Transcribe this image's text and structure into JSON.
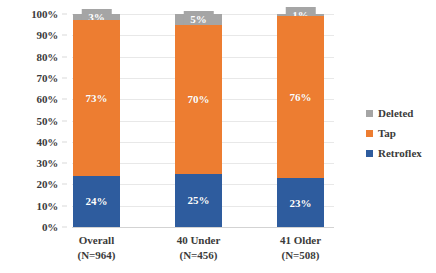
{
  "chart_data": {
    "type": "bar",
    "subtype": "stacked-100-percent",
    "title": "",
    "xlabel": "",
    "ylabel": "",
    "ylim": [
      0,
      100
    ],
    "grid": true,
    "legend_position": "right",
    "categories": [
      "Overall",
      "40 Under",
      "41 Older"
    ],
    "category_sublabels": [
      "(N=964)",
      "(N=456)",
      "(N=508)"
    ],
    "ytick_labels": [
      "100%",
      "90%",
      "80%",
      "70%",
      "60%",
      "50%",
      "40%",
      "30%",
      "20%",
      "10%",
      "0%"
    ],
    "ytick_values": [
      100,
      90,
      80,
      70,
      60,
      50,
      40,
      30,
      20,
      10,
      0
    ],
    "series": [
      {
        "name": "Retroflex",
        "color": "#2E5C9E",
        "values": [
          24,
          25,
          23
        ],
        "labels": [
          "24%",
          "25%",
          "23%"
        ]
      },
      {
        "name": "Tap",
        "color": "#ED7D31",
        "values": [
          73,
          70,
          76
        ],
        "labels": [
          "73%",
          "70%",
          "76%"
        ]
      },
      {
        "name": "Deleted",
        "color": "#A5A5A5",
        "values": [
          3,
          5,
          1
        ],
        "labels": [
          "3%",
          "5%",
          "1%"
        ]
      }
    ]
  },
  "legend": {
    "items": [
      {
        "label": "Deleted",
        "color": "#A5A5A5"
      },
      {
        "label": "Tap",
        "color": "#ED7D31"
      },
      {
        "label": "Retroflex",
        "color": "#2E5C9E"
      }
    ]
  }
}
